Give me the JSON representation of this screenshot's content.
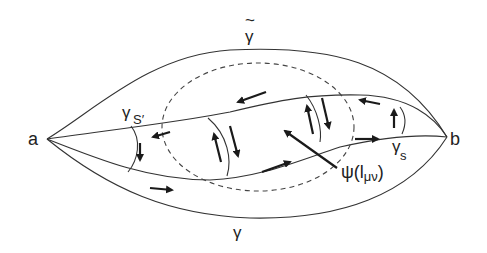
{
  "figure": {
    "points": {
      "a": {
        "label": "a"
      },
      "b": {
        "label": "b"
      }
    },
    "paths": {
      "gamma_tilde": {
        "label": "γ",
        "accent": "~",
        "description": "outer upper path"
      },
      "gamma": {
        "label": "γ",
        "description": "outer lower path"
      },
      "gamma_s_prime": {
        "label": "γ",
        "subscript": "S′",
        "description": "inner upper path"
      },
      "gamma_s": {
        "label": "γ",
        "subscript": "s",
        "description": "inner lower path"
      }
    },
    "region_label": {
      "psi": "ψ(",
      "sub_l": "l",
      "sub_munu": "μν",
      "close": ")"
    },
    "colors": {
      "stroke": "#333333",
      "arrow": "#1a1a1a",
      "background": "#ffffff"
    }
  }
}
